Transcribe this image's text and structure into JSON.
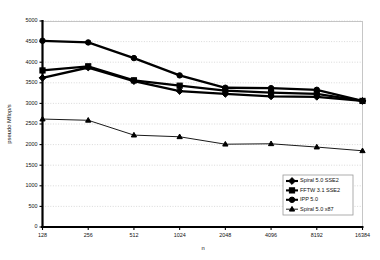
{
  "chart_data": {
    "type": "line",
    "title": "",
    "xlabel": "n",
    "ylabel": "pseudo Mflop/s",
    "categories": [
      "128",
      "256",
      "512",
      "1024",
      "2048",
      "4096",
      "8192",
      "16384"
    ],
    "ylim": [
      0,
      5000
    ],
    "yticks": [
      "0",
      "500",
      "1000",
      "1500",
      "2000",
      "2500",
      "3000",
      "3500",
      "4000",
      "4500",
      "5000"
    ],
    "ytick_values": [
      0,
      500,
      1000,
      1500,
      2000,
      2500,
      3000,
      3500,
      4000,
      4500,
      5000
    ],
    "grid": true,
    "legend_position": "bottom-right",
    "series": [
      {
        "name": "Spiral 5.0 SSE2",
        "marker": "diamond",
        "values": [
          3620,
          3870,
          3540,
          3300,
          3230,
          3170,
          3160,
          3060
        ]
      },
      {
        "name": "FFTW 3.1 SSE2",
        "marker": "square",
        "values": [
          3800,
          3900,
          3560,
          3430,
          3310,
          3260,
          3230,
          3060
        ]
      },
      {
        "name": "IPP 5.0",
        "marker": "circle",
        "values": [
          4520,
          4480,
          4100,
          3680,
          3380,
          3370,
          3330,
          3060
        ]
      },
      {
        "name": "Spiral 5.0 x87",
        "marker": "triangle",
        "values": [
          2620,
          2590,
          2230,
          2190,
          2010,
          2020,
          1940,
          1850
        ]
      }
    ]
  },
  "legend": {
    "items": [
      {
        "label": "Spiral 5.0 SSE2"
      },
      {
        "label": "FFTW 3.1 SSE2"
      },
      {
        "label": "IPP 5.0"
      },
      {
        "label": "Spiral 5.0 x87"
      }
    ]
  }
}
